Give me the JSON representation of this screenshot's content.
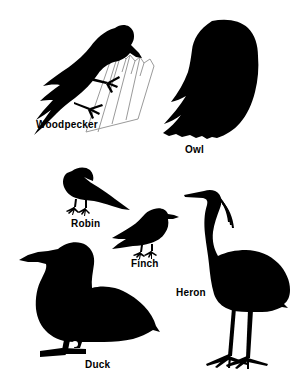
{
  "figure": {
    "background_color": "#ffffff",
    "silhouette_color": "#000000",
    "trunk_outline_color": "#9a9a9a",
    "width": 298,
    "height": 390
  },
  "birds": [
    {
      "id": "woodpecker",
      "label": "Woodpecker",
      "icon": "woodpecker-silhouette-icon",
      "label_x": 36,
      "label_y": 119,
      "pose": "clinging to tree trunk, facing right, tail down-left",
      "has_perch": true,
      "perch": "tree-trunk-outline"
    },
    {
      "id": "owl",
      "label": "Owl",
      "icon": "owl-silhouette-icon",
      "label_x": 185,
      "label_y": 144,
      "pose": "perched upright, rounded body, facing right"
    },
    {
      "id": "robin",
      "label": "Robin",
      "icon": "robin-silhouette-icon",
      "label_x": 71,
      "label_y": 224,
      "pose": "standing, facing left, tail right"
    },
    {
      "id": "finch",
      "label": "Finch",
      "icon": "finch-silhouette-icon",
      "label_x": 131,
      "label_y": 264,
      "pose": "standing, facing right, short tail left"
    },
    {
      "id": "heron",
      "label": "Heron",
      "icon": "heron-silhouette-icon",
      "label_x": 176,
      "label_y": 293,
      "pose": "standing tall, S-curved neck, facing left, long legs"
    },
    {
      "id": "duck",
      "label": "Duck",
      "icon": "duck-silhouette-icon",
      "label_x": 85,
      "label_y": 359,
      "pose": "standing, facing left, plump body, flat bill"
    }
  ]
}
